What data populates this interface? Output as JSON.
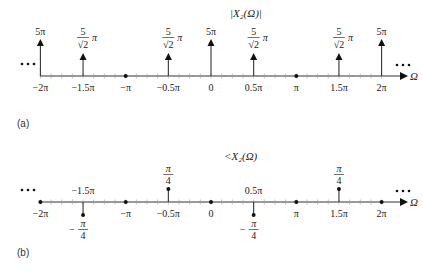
{
  "figure": {
    "panels": [
      {
        "id": "a",
        "caption": "(a)",
        "title": "|X₂(Ω)|",
        "axis_label": "Ω",
        "ellipsis": "• • •"
      },
      {
        "id": "b",
        "caption": "(b)",
        "title": "<X₂(Ω)",
        "axis_label": "Ω",
        "ellipsis": "• • •"
      }
    ]
  },
  "chart_data": [
    {
      "type": "stem",
      "title": "|X2(Ω)|",
      "xlabel": "Ω",
      "x_ticks": [
        "-2π",
        "-1.5π",
        "-π",
        "-0.5π",
        "0",
        "0.5π",
        "π",
        "1.5π",
        "2π"
      ],
      "x": [
        -2,
        -1.5,
        -1,
        -0.5,
        0,
        0.5,
        1,
        1.5,
        2
      ],
      "x_units": "π",
      "values": [
        15.708,
        11.107,
        0,
        11.107,
        15.708,
        11.107,
        0,
        11.107,
        15.708
      ],
      "value_labels": [
        "5π",
        "5/√2 π",
        "",
        "5/√2 π",
        "5π",
        "5/√2 π",
        "",
        "5/√2 π",
        "5π"
      ],
      "impulses": true,
      "periodic": true
    },
    {
      "type": "stem",
      "title": "<X2(Ω)",
      "xlabel": "Ω",
      "x_ticks": [
        "-2π",
        "-1.5π",
        "-π",
        "-0.5π",
        "0",
        "0.5π",
        "π",
        "1.5π",
        "2π"
      ],
      "x": [
        -2,
        -1.5,
        -1,
        -0.5,
        0,
        0.5,
        1,
        1.5,
        2
      ],
      "x_units": "π",
      "values": [
        0,
        -0.7854,
        0,
        0.7854,
        0,
        -0.7854,
        0,
        0.7854,
        0
      ],
      "value_labels": [
        "",
        "-π/4",
        "",
        "π/4",
        "",
        "-π/4",
        "",
        "π/4",
        ""
      ],
      "impulses": false,
      "periodic": true
    }
  ]
}
